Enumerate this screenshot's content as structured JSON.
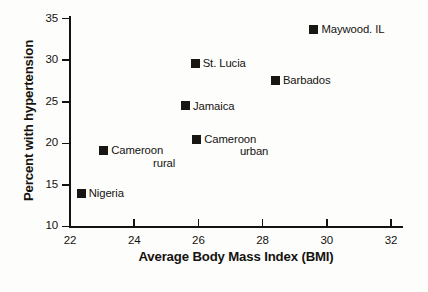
{
  "chart_data": {
    "type": "scatter",
    "title": "",
    "xlabel": "Average Body Mass Index (BMI)",
    "ylabel": "Percent with hypertension",
    "xlim": [
      22,
      32.5
    ],
    "ylim": [
      10,
      36
    ],
    "xticks": [
      "22",
      "24",
      "26",
      "28",
      "30",
      "32"
    ],
    "yticks": [
      "10",
      "15",
      "20",
      "25",
      "30",
      "35"
    ],
    "grid": false,
    "legend": "none",
    "points": [
      {
        "label": "Nigeria",
        "label_line1": "Nigeria",
        "label_line2": "",
        "x": 22.35,
        "y": 14.0
      },
      {
        "label": "Cameroon rural",
        "label_line1": "Cameroon",
        "label_line2": "rural",
        "x": 23.05,
        "y": 19.1
      },
      {
        "label": "Jamaica",
        "label_line1": "Jamaica",
        "label_line2": "",
        "x": 25.6,
        "y": 24.5
      },
      {
        "label": "Cameroon urban",
        "label_line1": "Cameroon",
        "label_line2": "urban",
        "x": 25.95,
        "y": 20.5
      },
      {
        "label": "St. Lucia",
        "label_line1": "St. Lucia",
        "label_line2": "",
        "x": 25.9,
        "y": 29.6
      },
      {
        "label": "Barbados",
        "label_line1": "Barbados",
        "label_line2": "",
        "x": 28.4,
        "y": 27.6
      },
      {
        "label": "Maywood. IL",
        "label_line1": "Maywood. IL",
        "label_line2": "",
        "x": 29.6,
        "y": 33.7
      }
    ],
    "marker_color": "#181613",
    "axis_color": "#15130f"
  }
}
